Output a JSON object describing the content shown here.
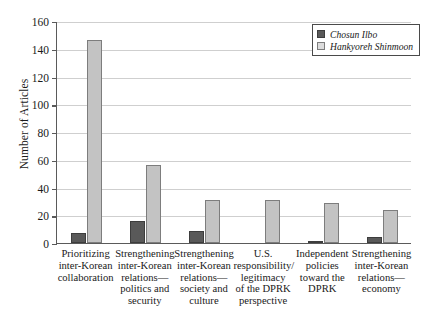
{
  "chart_data": {
    "type": "bar",
    "title": "",
    "xlabel": "",
    "ylabel": "Number of Articles",
    "ylim": [
      0,
      160
    ],
    "ytick_step": 20,
    "yticks": [
      0,
      20,
      40,
      60,
      80,
      100,
      120,
      140,
      160
    ],
    "ytick_labels": [
      "0",
      "20",
      "40",
      "60",
      "80",
      "100",
      "120",
      "140",
      "160"
    ],
    "grid": true,
    "legend_position": "top-right",
    "categories": [
      "Prioritizing inter-Korean collaboration",
      "Strengthening inter-Korean relations—politics and security",
      "Strengthening inter-Korean relations—society and culture",
      "U.S. responsibility/ legitimacy of the DPRK perspective",
      "Independent policies toward the DPRK",
      "Strengthening inter-Korean relations—economy"
    ],
    "category_lines": [
      [
        "Prioritizing",
        "inter-Korean",
        "collaboration"
      ],
      [
        "Strengthening",
        "inter-Korean",
        "relations—",
        "politics and",
        "security"
      ],
      [
        "Strengthening",
        "inter-Korean",
        "relations—",
        "society and",
        "culture"
      ],
      [
        "U.S.",
        "responsibility/",
        "legitimacy",
        "of the DPRK",
        "perspective"
      ],
      [
        "Independent",
        "policies",
        "toward the",
        "DPRK"
      ],
      [
        "Strengthening",
        "inter-Korean",
        "relations—",
        "economy"
      ]
    ],
    "series": [
      {
        "name": "Chosun Ilbo",
        "color": "#595959",
        "values": [
          7,
          16,
          9,
          0,
          1,
          4
        ]
      },
      {
        "name": "Hankyoreh Shinmoon",
        "color": "#c3c3c3",
        "values": [
          146,
          56,
          31,
          31,
          29,
          24
        ]
      }
    ]
  },
  "legend": {
    "items": [
      {
        "label": "Chosun Ilbo"
      },
      {
        "label": "Hankyoreh Shinmoon"
      }
    ]
  },
  "axis": {
    "y_title": "Number of Articles"
  }
}
